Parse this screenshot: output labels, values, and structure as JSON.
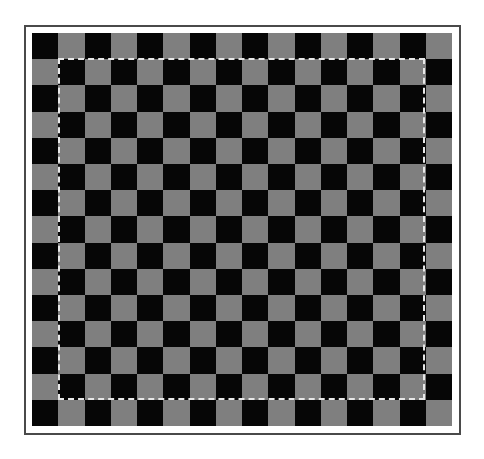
{
  "image": {
    "description": "Checkerboard pattern inside a thin frame with a dashed selection marquee",
    "board": {
      "columns": 16,
      "rows": 15,
      "top_left_color": "dark",
      "colors": {
        "dark": "#060606",
        "light": "#7f7f7f"
      }
    },
    "frame": {
      "color": "#4a4a4a",
      "background": "#ffffff"
    },
    "selection": {
      "style": "dashed",
      "color": "#e8e8e8",
      "inset_cells": 1
    }
  }
}
